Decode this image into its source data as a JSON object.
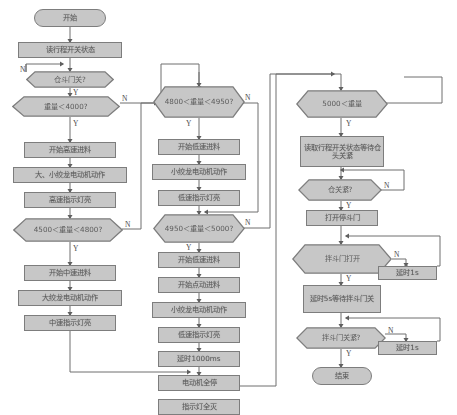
{
  "palette": {
    "node_fill": "#c7c7c7",
    "node_border": "#7d7d7d",
    "line": "#6f6f6f",
    "text": "#5c5c5c",
    "background": "#ffffff"
  },
  "branch_labels": {
    "yes": "Y",
    "no": "N"
  },
  "columns": {
    "left": {
      "nodes": [
        {
          "id": "start",
          "type": "terminal",
          "label": "开始"
        },
        {
          "id": "read_sw",
          "type": "process",
          "label": "读行程开关状态"
        },
        {
          "id": "door_closed",
          "type": "decision",
          "label": "仓斗门关?"
        },
        {
          "id": "w_lt_4000",
          "type": "decision",
          "label": "重量＜4000?"
        },
        {
          "id": "fast_feed",
          "type": "process",
          "label": "开始高速进料"
        },
        {
          "id": "motor_big_small",
          "type": "process",
          "label": "大、小绞龙电动机动作"
        },
        {
          "id": "fast_lamp",
          "type": "process",
          "label": "高速指示灯亮"
        },
        {
          "id": "w_4500_4800",
          "type": "decision",
          "label": "4500＜重量＜4800?"
        },
        {
          "id": "mid_feed",
          "type": "process",
          "label": "开始中速进料"
        },
        {
          "id": "motor_big",
          "type": "process",
          "label": "大绞龙电动机动作"
        },
        {
          "id": "mid_lamp",
          "type": "process",
          "label": "中速指示灯亮"
        }
      ]
    },
    "middle": {
      "nodes": [
        {
          "id": "w_4800_4950",
          "type": "decision",
          "label": "4800＜重量＜4950?"
        },
        {
          "id": "slow_feed",
          "type": "process",
          "label": "开始低速进料"
        },
        {
          "id": "motor_small",
          "type": "process",
          "label": "小绞龙电动机动作"
        },
        {
          "id": "slow_lamp",
          "type": "process",
          "label": "低速指示灯亮"
        },
        {
          "id": "w_4950_5000",
          "type": "decision",
          "label": "4950＜重量＜5000?"
        },
        {
          "id": "micro_feed",
          "type": "process",
          "label": "开始低速进料"
        },
        {
          "id": "point_feed",
          "type": "process",
          "label": "开始点动进料"
        },
        {
          "id": "motor_small2",
          "type": "process",
          "label": "小绞龙电动机动作"
        },
        {
          "id": "slow_lamp2",
          "type": "process",
          "label": "低速指示灯亮"
        },
        {
          "id": "delay_1000",
          "type": "process",
          "label": "延时1000ms"
        },
        {
          "id": "motor_stop",
          "type": "process",
          "label": "电动机全停"
        },
        {
          "id": "lamps_off",
          "type": "process",
          "label": "指示灯全灭"
        }
      ]
    },
    "right": {
      "nodes": [
        {
          "id": "w_gt_5000",
          "type": "decision",
          "label": "5000＜重量"
        },
        {
          "id": "read_sw2",
          "type": "process",
          "label": "读取行程开关状态等待仓头关紧"
        },
        {
          "id": "closed_tight",
          "type": "decision",
          "label": "仓关紧?"
        },
        {
          "id": "open_door",
          "type": "process",
          "label": "打开停斗门"
        },
        {
          "id": "door_open_q",
          "type": "decision",
          "label": "拌斗门打开"
        },
        {
          "id": "delay5_wait",
          "type": "process",
          "label": "延时5s等待拌斗门关"
        },
        {
          "id": "door_closed_q",
          "type": "decision",
          "label": "拌斗门关紧?"
        },
        {
          "id": "end",
          "type": "terminal",
          "label": "结束"
        }
      ],
      "side_nodes": [
        {
          "id": "delay_1s_a",
          "type": "process",
          "label": "延时1s"
        },
        {
          "id": "delay_1s_b",
          "type": "process",
          "label": "延时1s"
        }
      ]
    }
  }
}
